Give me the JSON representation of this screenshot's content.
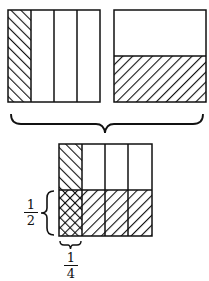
{
  "diagram": {
    "top_left_square": {
      "columns": 4,
      "shaded_columns": 1,
      "fraction": "1/4",
      "hatch": "forward"
    },
    "top_right_square": {
      "rows": 2,
      "shaded_rows": 1,
      "fraction": "1/2",
      "hatch": "backward"
    },
    "combined_square": {
      "columns": 4,
      "rows": 2,
      "overlap_cells": 1,
      "product": "1/8"
    },
    "labels": {
      "half": {
        "numerator": "1",
        "denominator": "2"
      },
      "quarter": {
        "numerator": "1",
        "denominator": "4"
      }
    },
    "colors": {
      "stroke": "#111111",
      "background": "#ffffff"
    }
  }
}
